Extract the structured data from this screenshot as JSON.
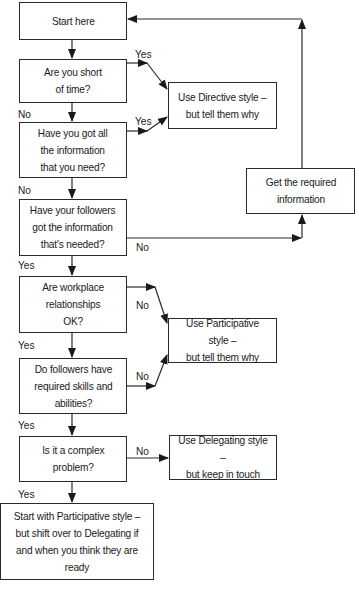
{
  "diagram": {
    "type": "flowchart",
    "colors": {
      "line": "#2a2a2a",
      "background": "#ffffff",
      "text": "#1a1a1a"
    },
    "nodes": {
      "start": {
        "text": "Start here"
      },
      "short_of_time": {
        "text": "Are you short\nof time?"
      },
      "have_info": {
        "text": "Have you got all\nthe information\nthat you need?"
      },
      "followers_info": {
        "text": "Have your followers\ngot the information\nthat's needed?"
      },
      "workplace": {
        "text": "Are workplace\nrelationships\nOK?"
      },
      "skills": {
        "text": "Do followers have\nrequired skills and\nabilities?"
      },
      "complex": {
        "text": "Is it a complex\nproblem?"
      },
      "final": {
        "text": "Start with Participative style –\nbut shift over to Delegating if\nand when you think they are ready"
      },
      "directive": {
        "text": "Use Directive style –\nbut tell them why"
      },
      "get_info": {
        "text": "Get the required\ninformation"
      },
      "participative": {
        "text": "Use Participative style –\nbut tell them why"
      },
      "delegating": {
        "text": "Use Delegating style –\nbut keep in touch"
      }
    },
    "edge_labels": {
      "short_yes": "Yes",
      "short_no": "No",
      "info_yes": "Yes",
      "info_no": "No",
      "followers_no": "No",
      "followers_yes": "Yes",
      "workplace_no": "No",
      "workplace_yes": "Yes",
      "skills_no": "No",
      "skills_yes": "Yes",
      "complex_no": "No",
      "complex_yes": "Yes"
    }
  }
}
